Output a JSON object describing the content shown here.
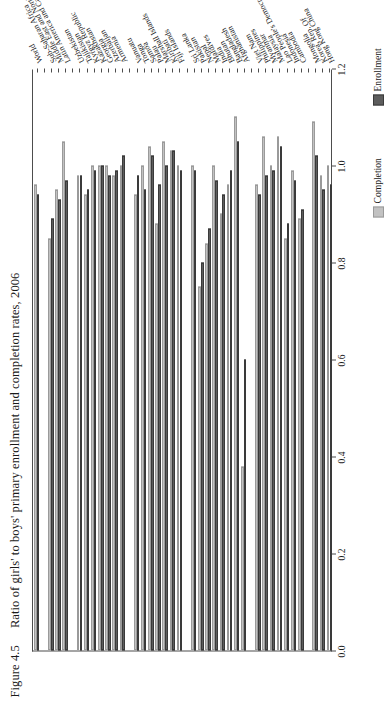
{
  "figure": {
    "number": "Figure 4.5",
    "title": "Ratio of girls' to boys' primary enrollment and completion rates, 2006"
  },
  "legend": {
    "position": "right-middle",
    "entries": [
      {
        "label": "Completion",
        "color": "#c2c2c2"
      },
      {
        "label": "Enrollment",
        "color": "#5d5d5d"
      }
    ]
  },
  "chart_data": {
    "type": "bar",
    "orientation": "horizontal",
    "title": "Ratio of girls' to boys' primary enrollment and completion rates, 2006",
    "xlabel": "",
    "ylabel": "",
    "xlim": [
      0.0,
      1.2
    ],
    "xticks": [
      "0.0",
      "0.2",
      "0.4",
      "0.6",
      "0.8",
      "1.0",
      "1.2"
    ],
    "grid": false,
    "categories": [
      "Hong Kong China",
      "Korea, Rep. Of",
      "Mongolia",
      "",
      "Cambodia",
      "Indonesia",
      "Lao People's Democratic Republic",
      "Malaysia",
      "Myanmar",
      "Philippines",
      "Viet Nam",
      "",
      "Afghanistan",
      "Bangladesh",
      "Bhutan",
      "India",
      "Maldives",
      "Nepal",
      "Pakistan",
      "Sri Lanka",
      "",
      "Fiji Islands",
      "Kiribati",
      "Marshall Islands",
      "Palau",
      "Samoa",
      "Tonga",
      "Vanuatu",
      "",
      "Armenia",
      "Azerbaijan",
      "Georgia",
      "Kazakhstan",
      "Kyrgyz Republic",
      "Tajikistan",
      "Uzbekistan",
      "",
      "Latin America and Caribbean",
      "Middle East and North Africa",
      "Sub-Saharan Africa",
      "",
      "World"
    ],
    "series": [
      {
        "name": "Enrollment",
        "color": "#5d5d5d",
        "values": [
          0.96,
          0.95,
          1.02,
          null,
          0.91,
          0.97,
          0.88,
          1.04,
          0.99,
          0.98,
          0.94,
          null,
          0.6,
          1.05,
          0.99,
          0.94,
          0.97,
          0.87,
          0.8,
          0.99,
          null,
          0.99,
          1.03,
          1.0,
          0.96,
          1.02,
          0.95,
          0.98,
          null,
          1.02,
          0.99,
          0.98,
          1.0,
          0.99,
          0.95,
          0.98,
          null,
          0.97,
          0.93,
          0.89,
          null,
          0.94
        ]
      },
      {
        "name": "Completion",
        "color": "#c2c2c2",
        "values": [
          1.0,
          0.98,
          1.09,
          null,
          0.89,
          0.99,
          0.85,
          1.06,
          1.0,
          1.06,
          0.96,
          null,
          0.38,
          1.1,
          0.96,
          0.9,
          1.0,
          0.84,
          0.75,
          1.0,
          null,
          1.0,
          1.03,
          1.05,
          0.88,
          1.04,
          1.0,
          0.94,
          null,
          1.0,
          0.98,
          1.0,
          1.0,
          1.0,
          0.94,
          0.98,
          null,
          1.05,
          0.95,
          0.85,
          null,
          0.96
        ]
      }
    ]
  }
}
